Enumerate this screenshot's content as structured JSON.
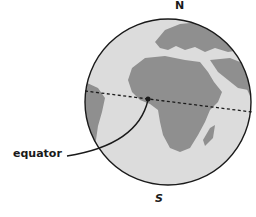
{
  "labels": {
    "north": "N",
    "south": "S",
    "equator": "equator"
  },
  "colors": {
    "ocean": "#dcdcdc",
    "land": "#8f8f8f",
    "outline": "#1a1a1a"
  }
}
